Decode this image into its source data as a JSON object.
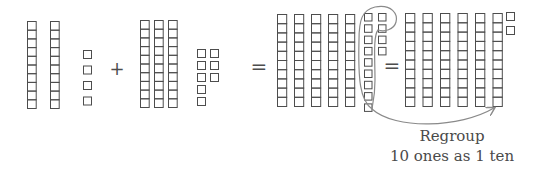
{
  "diagram": {
    "stroke_color": "#4d4d4d",
    "loop_color": "#8a8a8a",
    "groups": [
      {
        "name": "addend-1",
        "tens": 2,
        "ones": 4,
        "value": 24
      },
      {
        "name": "addend-2",
        "tens": 3,
        "ones": 7,
        "value": 37
      },
      {
        "name": "sum-before-regroup",
        "tens": 5,
        "ones": 11
      },
      {
        "name": "sum-after-regroup",
        "tens": 6,
        "ones": 1,
        "value": 61
      }
    ],
    "operators": {
      "plus": "+",
      "equals_1": "=",
      "equals_2": "="
    },
    "annotation": {
      "line1": "Regroup",
      "line2": "10 ones as 1 ten"
    }
  }
}
